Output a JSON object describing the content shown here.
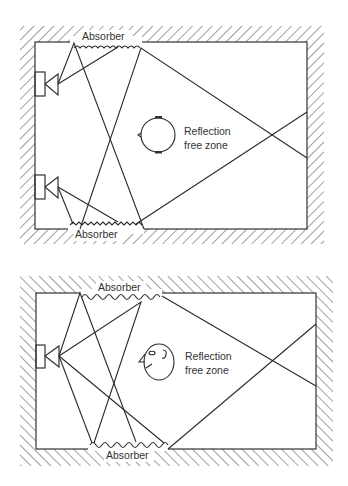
{
  "figure": {
    "panels": [
      {
        "id": "top",
        "description": "Room with two loudspeakers on left wall; absorbers on top and bottom walls",
        "labels": {
          "absorber_top": "Absorber",
          "absorber_bottom": "Absorber",
          "zone_line1": "Reflection",
          "zone_line2": "free zone"
        },
        "speakers": 2,
        "listener_icon": "head-top-view-icon"
      },
      {
        "id": "bottom",
        "description": "Room with one loudspeaker on left wall; absorbers on top and bottom walls",
        "labels": {
          "absorber_top": "Absorber",
          "absorber_bottom": "Absorber",
          "zone_line1": "Reflection",
          "zone_line2": "free zone"
        },
        "speakers": 1,
        "listener_icon": "face-side-view-icon"
      }
    ],
    "colors": {
      "line": "#2a2a2a",
      "background": "#ffffff",
      "text": "#333333"
    }
  }
}
